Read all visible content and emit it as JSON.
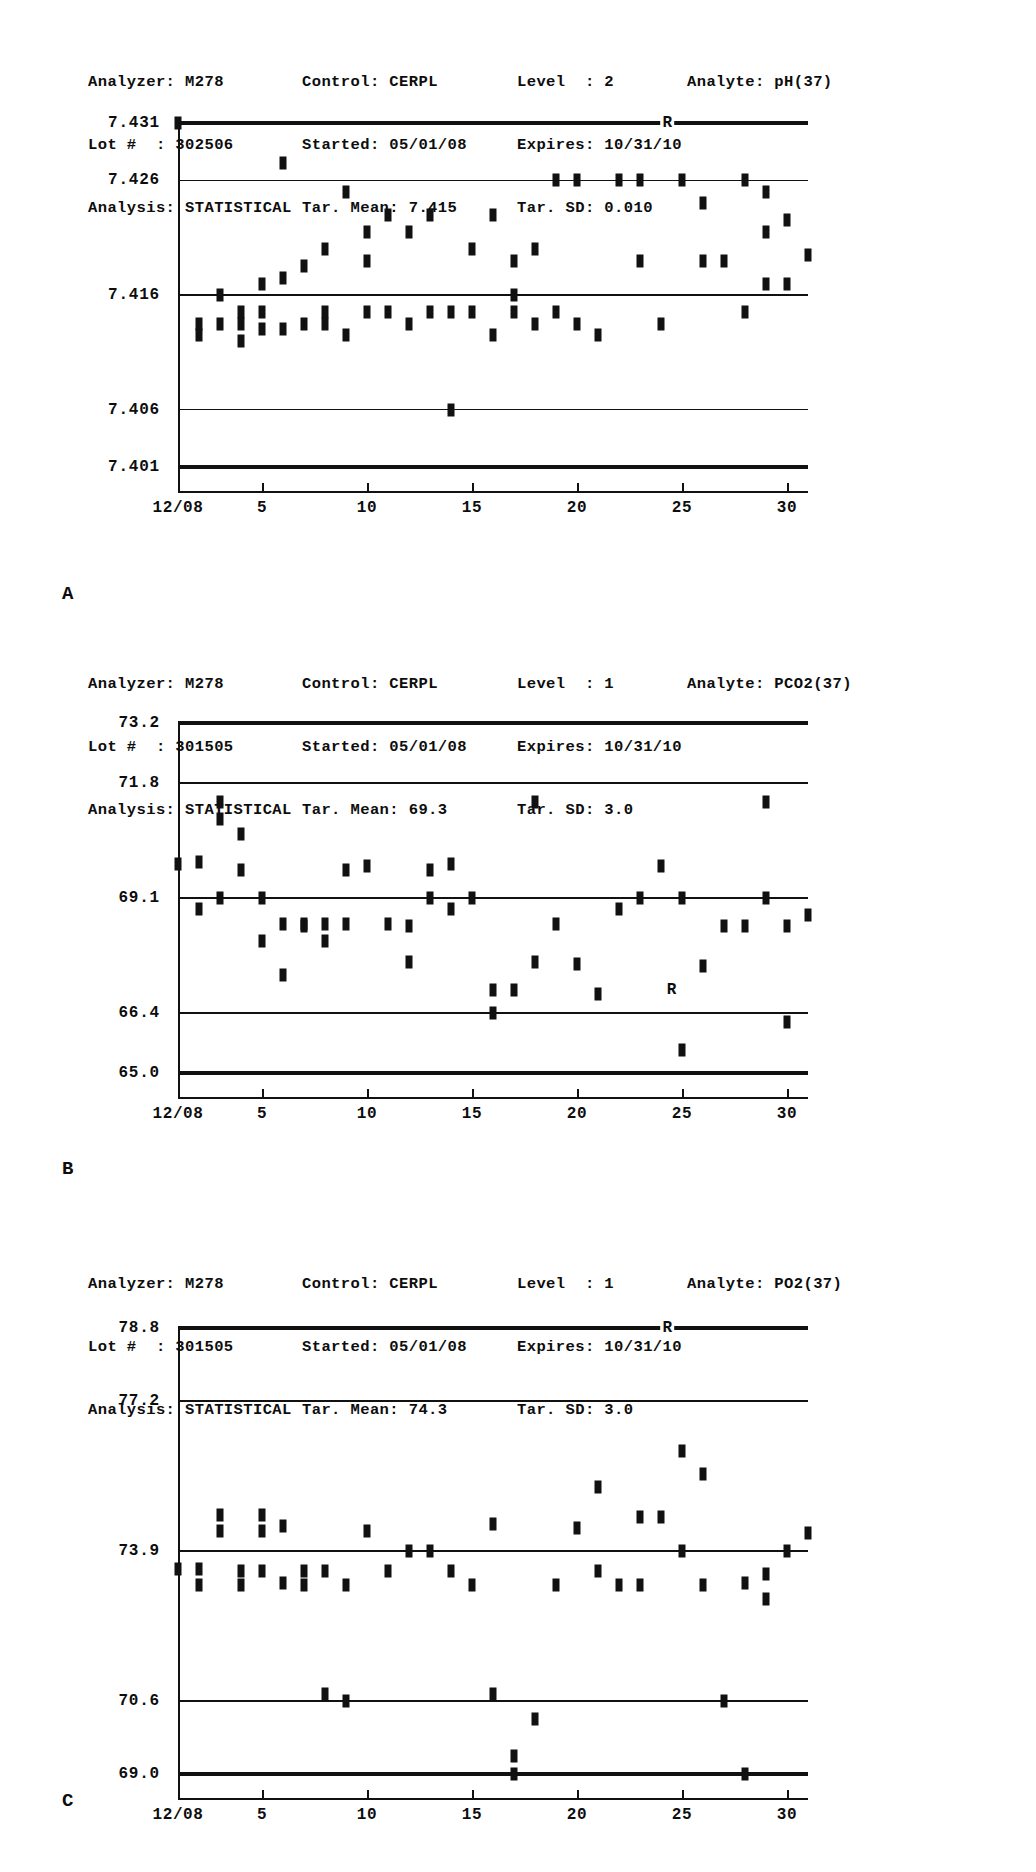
{
  "panels": [
    {
      "letter": "A",
      "header": {
        "analyzer_label": "Analyzer:",
        "analyzer_value": "M278",
        "control_label": "Control:",
        "control_value": "CERPL",
        "level_label": "Level  :",
        "level_value": "2",
        "analyte_label": "Analyte:",
        "analyte_value": "pH(37)",
        "lot_label": "Lot #  :",
        "lot_value": "302506",
        "started_label": "Started:",
        "started_value": "05/01/08",
        "expires_label": "Expires:",
        "expires_value": "10/31/10",
        "analysis_label": "Analysis:",
        "analysis_value": "STATISTICAL",
        "tar_mean_label": "Tar. Mean:",
        "tar_mean_value": "7.415",
        "tar_sd_label": "Tar. SD:",
        "tar_sd_value": "0.010"
      },
      "x_labels": [
        "12/08",
        "5",
        "10",
        "15",
        "20",
        "25",
        "30"
      ],
      "reject_marker": "R"
    },
    {
      "letter": "B",
      "header": {
        "analyzer_label": "Analyzer:",
        "analyzer_value": "M278",
        "control_label": "Control:",
        "control_value": "CERPL",
        "level_label": "Level  :",
        "level_value": "1",
        "analyte_label": "Analyte:",
        "analyte_value": "PCO2(37)",
        "lot_label": "Lot #  :",
        "lot_value": "301505",
        "started_label": "Started:",
        "started_value": "05/01/08",
        "expires_label": "Expires:",
        "expires_value": "10/31/10",
        "analysis_label": "Analysis:",
        "analysis_value": "STATISTICAL",
        "tar_mean_label": "Tar. Mean:",
        "tar_mean_value": "69.3",
        "tar_sd_label": "Tar. SD:",
        "tar_sd_value": "3.0"
      },
      "x_labels": [
        "12/08",
        "5",
        "10",
        "15",
        "20",
        "25",
        "30"
      ],
      "reject_marker": "R"
    },
    {
      "letter": "C",
      "header": {
        "analyzer_label": "Analyzer:",
        "analyzer_value": "M278",
        "control_label": "Control:",
        "control_value": "CERPL",
        "level_label": "Level  :",
        "level_value": "1",
        "analyte_label": "Analyte:",
        "analyte_value": "PO2(37)",
        "lot_label": "Lot #  :",
        "lot_value": "301505",
        "started_label": "Started:",
        "started_value": "05/01/08",
        "expires_label": "Expires:",
        "expires_value": "10/31/10",
        "analysis_label": "Analysis:",
        "analysis_value": "STATISTICAL",
        "tar_mean_label": "Tar. Mean:",
        "tar_mean_value": "74.3",
        "tar_sd_label": "Tar. SD:",
        "tar_sd_value": "3.0"
      },
      "x_labels": [
        "12/08",
        "5",
        "10",
        "15",
        "20",
        "25",
        "30"
      ],
      "reject_marker": "R"
    }
  ],
  "chart_data": [
    {
      "type": "scatter",
      "panel": "A",
      "title": "Levey-Jennings chart - pH(37) Level 2",
      "xlabel": "",
      "ylabel": "",
      "ylim": [
        7.401,
        7.431
      ],
      "yticks": [
        7.431,
        7.426,
        7.416,
        7.406,
        7.401
      ],
      "ytick_labels": [
        "7.431",
        "7.426",
        "7.416",
        "7.406",
        "7.401"
      ],
      "target_mean": 7.415,
      "target_sd": 0.01,
      "grid": true,
      "xlim": [
        1,
        31
      ],
      "xticks": [
        1,
        5,
        10,
        15,
        20,
        25,
        30
      ],
      "xtick_labels": [
        "12/08",
        "5",
        "10",
        "15",
        "20",
        "25",
        "30"
      ],
      "annotations": [
        {
          "text": "R",
          "x": 24.3,
          "y": 7.431
        }
      ],
      "x": [
        1,
        2,
        2,
        3,
        3,
        4,
        4,
        4,
        5,
        5,
        5,
        6,
        6,
        6,
        7,
        7,
        8,
        8,
        8,
        9,
        9,
        10,
        10,
        10,
        11,
        11,
        12,
        12,
        13,
        13,
        14,
        14,
        15,
        15,
        16,
        16,
        17,
        17,
        17,
        18,
        18,
        19,
        19,
        20,
        20,
        21,
        22,
        23,
        23,
        24,
        25,
        26,
        26,
        27,
        28,
        28,
        29,
        29,
        29,
        30,
        30,
        31
      ],
      "y": [
        7.431,
        7.4135,
        7.4125,
        7.416,
        7.4135,
        7.4145,
        7.4135,
        7.412,
        7.417,
        7.4145,
        7.413,
        7.4275,
        7.4175,
        7.413,
        7.4185,
        7.4135,
        7.42,
        7.4145,
        7.4135,
        7.425,
        7.4125,
        7.4215,
        7.419,
        7.4145,
        7.423,
        7.4145,
        7.4215,
        7.4135,
        7.423,
        7.4145,
        7.4145,
        7.406,
        7.42,
        7.4145,
        7.423,
        7.4125,
        7.416,
        7.419,
        7.4145,
        7.42,
        7.4135,
        7.426,
        7.4145,
        7.426,
        7.4135,
        7.4125,
        7.426,
        7.426,
        7.419,
        7.4135,
        7.426,
        7.424,
        7.419,
        7.419,
        7.426,
        7.4145,
        7.425,
        7.4215,
        7.417,
        7.4225,
        7.417,
        7.4195
      ]
    },
    {
      "type": "scatter",
      "panel": "B",
      "title": "Levey-Jennings chart - PCO2(37) Level 1",
      "xlabel": "",
      "ylabel": "",
      "ylim": [
        65.0,
        73.2
      ],
      "yticks": [
        73.2,
        71.8,
        69.1,
        66.4,
        65.0
      ],
      "ytick_labels": [
        "73.2",
        "71.8",
        "69.1",
        "66.4",
        "65.0"
      ],
      "target_mean": 69.3,
      "target_sd": 3.0,
      "grid": true,
      "xlim": [
        1,
        31
      ],
      "xticks": [
        1,
        5,
        10,
        15,
        20,
        25,
        30
      ],
      "xtick_labels": [
        "12/08",
        "5",
        "10",
        "15",
        "20",
        "25",
        "30"
      ],
      "annotations": [
        {
          "text": "R",
          "x": 24.5,
          "y": 66.95
        }
      ],
      "x": [
        1,
        2,
        2,
        3,
        3,
        3,
        4,
        4,
        5,
        5,
        6,
        6,
        7,
        7,
        8,
        8,
        9,
        9,
        10,
        11,
        12,
        12,
        13,
        13,
        14,
        14,
        15,
        16,
        16,
        17,
        18,
        18,
        19,
        20,
        21,
        22,
        23,
        24,
        25,
        25,
        26,
        27,
        28,
        29,
        29,
        30,
        30,
        31
      ],
      "y": [
        69.9,
        69.95,
        68.85,
        71.35,
        70.95,
        69.1,
        70.6,
        69.75,
        69.1,
        68.1,
        68.5,
        67.3,
        68.5,
        68.45,
        68.5,
        68.1,
        69.75,
        68.5,
        69.85,
        68.5,
        68.45,
        67.6,
        69.75,
        69.1,
        69.9,
        68.85,
        69.1,
        66.4,
        66.95,
        66.95,
        71.35,
        67.6,
        68.5,
        67.55,
        66.85,
        68.85,
        69.1,
        69.85,
        69.1,
        65.55,
        67.5,
        68.45,
        68.45,
        71.35,
        69.1,
        68.45,
        66.2,
        68.7
      ]
    },
    {
      "type": "scatter",
      "panel": "C",
      "title": "Levey-Jennings chart - PO2(37) Level 1",
      "xlabel": "",
      "ylabel": "",
      "ylim": [
        69.0,
        78.8
      ],
      "yticks": [
        78.8,
        77.2,
        73.9,
        70.6,
        69.0
      ],
      "ytick_labels": [
        "78.8",
        "77.2",
        "73.9",
        "70.6",
        "69.0"
      ],
      "target_mean": 74.3,
      "target_sd": 3.0,
      "grid": true,
      "xlim": [
        1,
        31
      ],
      "xticks": [
        1,
        5,
        10,
        15,
        20,
        25,
        30
      ],
      "xtick_labels": [
        "12/08",
        "5",
        "10",
        "15",
        "20",
        "25",
        "30"
      ],
      "annotations": [
        {
          "text": "R",
          "x": 24.3,
          "y": 78.8
        }
      ],
      "x": [
        1,
        2,
        2,
        3,
        3,
        4,
        4,
        5,
        5,
        5,
        6,
        6,
        7,
        7,
        8,
        8,
        9,
        9,
        10,
        11,
        12,
        13,
        14,
        15,
        16,
        16,
        17,
        17,
        18,
        19,
        20,
        21,
        21,
        22,
        23,
        23,
        24,
        25,
        25,
        26,
        26,
        27,
        28,
        28,
        29,
        29,
        30,
        31
      ],
      "y": [
        73.5,
        73.5,
        73.15,
        74.7,
        74.35,
        73.45,
        73.15,
        74.7,
        74.35,
        73.45,
        74.45,
        73.2,
        73.45,
        73.15,
        73.45,
        70.75,
        73.15,
        70.6,
        74.35,
        73.45,
        73.9,
        73.9,
        73.45,
        73.15,
        74.5,
        70.75,
        69.4,
        69.0,
        70.2,
        73.15,
        74.4,
        75.3,
        73.45,
        73.15,
        74.65,
        73.15,
        74.65,
        76.1,
        73.9,
        75.6,
        73.15,
        70.6,
        69.0,
        73.2,
        73.4,
        72.85,
        73.9,
        74.3
      ]
    }
  ]
}
